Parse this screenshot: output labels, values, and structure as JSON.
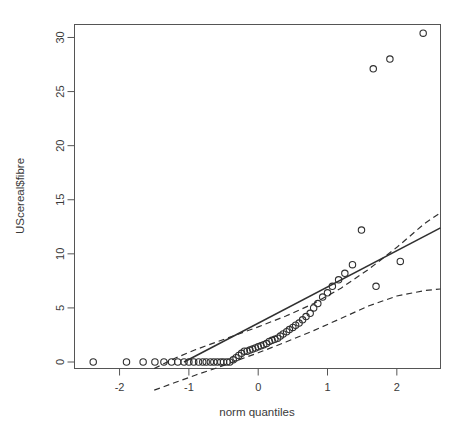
{
  "chart_data": {
    "type": "scatter",
    "title": "",
    "subtitle": "",
    "xlabel": "norm quantiles",
    "ylabel": "UScereal$fibre",
    "xlim": [
      -2.65,
      2.63
    ],
    "ylim": [
      -0.6,
      31.2
    ],
    "xticks": [
      -2,
      -1,
      0,
      1,
      2
    ],
    "xtick_labels": [
      "-2",
      "-1",
      "0",
      "1",
      "2"
    ],
    "yticks": [
      0,
      5,
      10,
      15,
      20,
      25,
      30
    ],
    "ytick_labels": [
      "0",
      "5",
      "10",
      "15",
      "20",
      "25",
      "30"
    ],
    "grid": false,
    "legend": null,
    "point_marker": "open-circle",
    "point_color": "#303030",
    "line_color": "#303030",
    "band_color": "#303030",
    "series": [
      {
        "name": "sample quantiles",
        "x": [
          -2.38,
          -1.9,
          -1.66,
          -1.49,
          -1.36,
          -1.25,
          -1.16,
          -1.07,
          -1.0,
          -0.93,
          -0.86,
          -0.8,
          -0.75,
          -0.69,
          -0.64,
          -0.59,
          -0.54,
          -0.5,
          -0.45,
          -0.41,
          -0.36,
          -0.32,
          -0.28,
          -0.24,
          -0.2,
          -0.16,
          -0.12,
          -0.08,
          -0.04,
          0.0,
          0.04,
          0.08,
          0.12,
          0.16,
          0.2,
          0.24,
          0.28,
          0.32,
          0.36,
          0.41,
          0.45,
          0.5,
          0.54,
          0.59,
          0.64,
          0.69,
          0.75,
          0.8,
          0.86,
          0.93,
          1.0,
          1.07,
          1.16,
          1.25,
          1.36,
          1.49,
          1.66,
          1.7,
          1.9,
          2.05,
          2.38
        ],
        "y": [
          0.0,
          0.0,
          0.0,
          0.0,
          0.0,
          0.0,
          0.0,
          0.0,
          0.0,
          0.0,
          0.0,
          0.0,
          0.0,
          0.0,
          0.0,
          0.0,
          0.0,
          0.0,
          0.0,
          0.0,
          0.2,
          0.4,
          0.6,
          0.8,
          1.0,
          1.0,
          1.1,
          1.2,
          1.3,
          1.4,
          1.5,
          1.6,
          1.7,
          1.9,
          2.0,
          2.1,
          2.2,
          2.4,
          2.6,
          2.8,
          3.0,
          3.2,
          3.4,
          3.6,
          3.9,
          4.2,
          4.5,
          5.0,
          5.4,
          6.0,
          6.4,
          7.0,
          7.6,
          8.2,
          9.0,
          12.2,
          27.1,
          7.0,
          28.0,
          9.3,
          30.4
        ]
      }
    ],
    "reference_line": {
      "style": "solid",
      "x_start": -1.07,
      "y_start": 0.0,
      "x_end": 2.63,
      "y_end": 12.4
    },
    "confidence_bands": {
      "style": "dashed",
      "upper": {
        "x": [
          -1.5,
          -1.2,
          -0.9,
          -0.6,
          -0.3,
          0.0,
          0.4,
          0.8,
          1.2,
          1.6,
          2.0,
          2.4,
          2.63
        ],
        "y": [
          -0.6,
          0.35,
          1.15,
          1.85,
          2.55,
          3.25,
          4.25,
          5.4,
          6.85,
          8.6,
          10.6,
          12.8,
          13.8
        ]
      },
      "lower": {
        "x": [
          -1.5,
          -1.2,
          -0.9,
          -0.6,
          -0.3,
          0.0,
          0.4,
          0.8,
          1.2,
          1.6,
          2.0,
          2.4,
          2.63
        ],
        "y": [
          -2.6,
          -1.9,
          -1.2,
          -0.55,
          0.15,
          0.85,
          1.85,
          2.9,
          4.05,
          5.2,
          6.1,
          6.6,
          6.75
        ]
      }
    }
  }
}
